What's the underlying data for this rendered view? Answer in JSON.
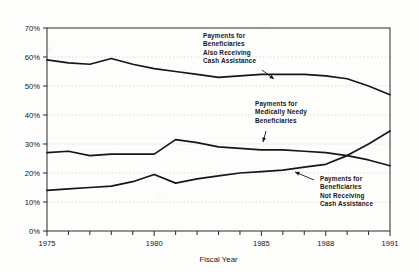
{
  "chart_data": {
    "type": "line",
    "title": "",
    "xlabel": "Fiscal Year",
    "ylabel": "",
    "xlim": [
      1975,
      1991
    ],
    "ylim": [
      0,
      70
    ],
    "grid": true,
    "legend_position": "inline-annotations",
    "ytick_labels": [
      "0%",
      "10%",
      "20%",
      "30%",
      "40%",
      "50%",
      "60%",
      "70%"
    ],
    "ytick_values": [
      0,
      10,
      20,
      30,
      40,
      50,
      60,
      70
    ],
    "xtick_labels": [
      "1975",
      "1980",
      "1985",
      "1988",
      "1991"
    ],
    "xtick_values": [
      1975,
      1980,
      1985,
      1988,
      1991
    ],
    "x": [
      1975,
      1976,
      1977,
      1978,
      1979,
      1980,
      1981,
      1982,
      1983,
      1984,
      1985,
      1986,
      1987,
      1988,
      1989,
      1990,
      1991
    ],
    "series": [
      {
        "name": "Payments for Beneficiaries Also Receiving Cash Assistance",
        "values": [
          59.0,
          58.0,
          57.5,
          59.5,
          57.5,
          56.0,
          55.0,
          54.0,
          53.0,
          53.5,
          54.0,
          54.0,
          54.0,
          53.5,
          52.5,
          50.0,
          47.0
        ]
      },
      {
        "name": "Payments for Medically Needy Beneficiaries",
        "values": [
          27.0,
          27.5,
          26.0,
          26.5,
          26.5,
          26.5,
          31.5,
          30.5,
          29.0,
          28.5,
          28.0,
          28.0,
          27.5,
          27.0,
          26.0,
          24.5,
          22.5
        ]
      },
      {
        "name": "Payments for Beneficiaries Not Receiving Cash Assistance",
        "values": [
          14.0,
          14.5,
          15.0,
          15.5,
          17.0,
          19.5,
          16.5,
          18.0,
          19.0,
          20.0,
          20.5,
          21.0,
          22.0,
          23.0,
          26.0,
          30.0,
          34.5
        ]
      }
    ],
    "annotations": [
      {
        "id": "annotation-also-receiving",
        "lines": [
          "Payments for",
          "Beneficiaries",
          "Also Receiving",
          "Cash Assistance"
        ],
        "points_to_series": "Payments for Beneficiaries Also Receiving Cash Assistance"
      },
      {
        "id": "annotation-medically-needy",
        "lines": [
          "Payments for",
          "Medically Needy",
          "Beneficiaries"
        ],
        "points_to_series": "Payments for Medically Needy Beneficiaries"
      },
      {
        "id": "annotation-not-receiving",
        "lines": [
          "Payments for",
          "Beneficiaries",
          "Not Receiving",
          "Cash Assistance"
        ],
        "points_to_series": "Payments for Beneficiaries Not Receiving Cash Assistance"
      }
    ],
    "colors": {
      "line": "#161616",
      "grid": "#b9b9b9",
      "axis": "#2a2a2a",
      "background": "#fdfdfb"
    }
  }
}
